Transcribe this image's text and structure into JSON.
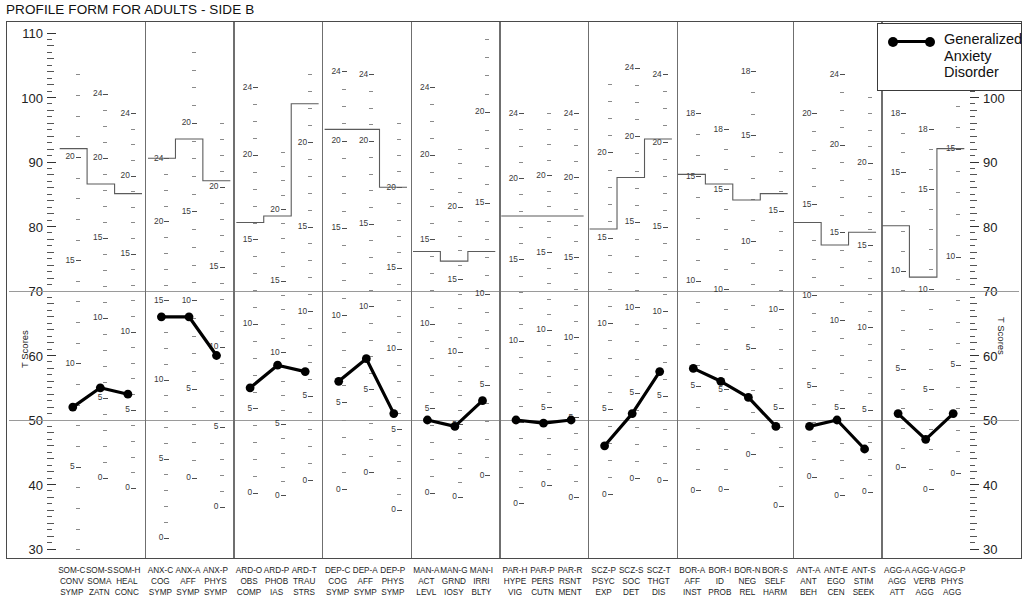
{
  "title": "PROFILE FORM FOR ADULTS - SIDE B",
  "axis": {
    "y_title": "T Scores",
    "y_ticks": [
      110,
      100,
      90,
      80,
      70,
      60,
      50,
      40,
      30
    ],
    "y_min": 30,
    "y_max": 110,
    "reference_lines": [
      70,
      50
    ]
  },
  "legend": {
    "position": "top-right",
    "entries": [
      {
        "label": "Generalized Anxiety Disorder",
        "marker": "line-with-dots",
        "color": "#000000"
      }
    ]
  },
  "chart_data": {
    "type": "line",
    "title": "PROFILE FORM FOR ADULTS - SIDE B",
    "xlabel": "",
    "ylabel": "T Scores",
    "ylim": [
      30,
      110
    ],
    "grid": false,
    "reference_lines": [
      70,
      50
    ],
    "legend": [
      "Generalized Anxiety Disorder"
    ],
    "categories": [
      "SOM-C",
      "SOM-S",
      "SOM-H",
      "ANX-C",
      "ANX-A",
      "ANX-P",
      "ARD-O",
      "ARD-P",
      "ARD-T",
      "DEP-C",
      "DEP-A",
      "DEP-P",
      "MAN-A",
      "MAN-G",
      "MAN-I",
      "PAR-H",
      "PAR-P",
      "PAR-R",
      "SCZ-P",
      "SCZ-S",
      "SCZ-T",
      "BOR-A",
      "BOR-I",
      "BOR-N",
      "BOR-S",
      "ANT-A",
      "ANT-E",
      "ANT-S",
      "AGG-A",
      "AGG-V",
      "AGG-P"
    ],
    "series": [
      {
        "name": "Generalized Anxiety Disorder",
        "values": [
          52,
          55,
          54,
          66,
          66,
          60,
          55,
          58.5,
          57.5,
          56,
          59.5,
          51,
          50,
          49,
          53,
          50,
          49.5,
          50,
          46,
          51,
          57.5,
          58,
          56,
          53.5,
          49,
          49,
          50,
          45.5,
          51,
          47,
          51
        ]
      }
    ]
  },
  "groups": [
    {
      "name": "SOM",
      "columns": [
        {
          "code": "SOM-C",
          "l1": "SOM-C",
          "l2": "CONV",
          "l3": "SYMP",
          "value": 52,
          "max_t": 92,
          "ladder": {
            "raw_top": 24,
            "t_top": 103.5,
            "t_per_raw": 3.2,
            "labels": [
              20,
              15,
              10,
              5,
              0
            ]
          }
        },
        {
          "code": "SOM-S",
          "l1": "SOM-S",
          "l2": "SOMA",
          "l3": "ZATN",
          "value": 55,
          "max_t": 86.5,
          "ladder": {
            "raw_top": 24,
            "t_top": 100.5,
            "t_per_raw": 2.48,
            "labels": [
              24,
              20,
              15,
              10,
              5,
              0
            ]
          }
        },
        {
          "code": "SOM-H",
          "l1": "SOM-H",
          "l2": "HEAL",
          "l3": "CONC",
          "value": 54,
          "max_t": 85,
          "ladder": {
            "raw_top": 24,
            "t_top": 97.5,
            "t_per_raw": 2.42,
            "labels": [
              24,
              20,
              15,
              10,
              5,
              0
            ]
          }
        }
      ]
    },
    {
      "name": "ANX",
      "columns": [
        {
          "code": "ANX-C",
          "l1": "ANX-C",
          "l2": "COG",
          "l3": "SYMP",
          "value": 66,
          "max_t": 90.5,
          "ladder": {
            "raw_top": 24,
            "t_top": 90.5,
            "t_per_raw": 2.45,
            "labels": [
              24,
              20,
              15,
              10,
              5,
              0
            ]
          }
        },
        {
          "code": "ANX-A",
          "l1": "ANX-A",
          "l2": "AFF",
          "l3": "SYMP",
          "value": 66,
          "max_t": 93.5,
          "ladder": {
            "raw_top": 24,
            "t_top": 107,
            "t_per_raw": 2.75,
            "labels": [
              20,
              15,
              10,
              5,
              0
            ]
          }
        },
        {
          "code": "ANX-P",
          "l1": "ANX-P",
          "l2": "PHYS",
          "l3": "SYMP",
          "value": 60,
          "max_t": 87,
          "ladder": {
            "raw_top": 24,
            "t_top": 96,
            "t_per_raw": 2.48,
            "labels": [
              20,
              15,
              10,
              5,
              0
            ]
          }
        }
      ]
    },
    {
      "name": "ARD",
      "columns": [
        {
          "code": "ARD-O",
          "l1": "ARD-O",
          "l2": "OBS",
          "l3": "COMP",
          "value": 55,
          "max_t": 80.5,
          "ladder": {
            "raw_top": 24,
            "t_top": 101.5,
            "t_per_raw": 2.62,
            "labels": [
              24,
              20,
              15,
              10,
              5,
              0
            ]
          }
        },
        {
          "code": "ARD-P",
          "l1": "ARD-P",
          "l2": "PHOB",
          "l3": "IAS",
          "value": 58.5,
          "max_t": 81.5,
          "ladder": {
            "raw_top": 24,
            "t_top": 91.5,
            "t_per_raw": 2.22,
            "labels": [
              20,
              15,
              10,
              5,
              0
            ]
          }
        },
        {
          "code": "ARD-T",
          "l1": "ARD-T",
          "l2": "TRAU",
          "l3": "STRS",
          "value": 57.5,
          "max_t": 99,
          "ladder": {
            "raw_top": 24,
            "t_top": 103.5,
            "t_per_raw": 2.62,
            "labels": [
              20,
              15,
              10,
              5,
              0
            ]
          }
        }
      ]
    },
    {
      "name": "DEP",
      "columns": [
        {
          "code": "DEP-C",
          "l1": "DEP-C",
          "l2": "COG",
          "l3": "SYMP",
          "value": 56,
          "max_t": 95,
          "ladder": {
            "raw_top": 24,
            "t_top": 104,
            "t_per_raw": 2.7,
            "labels": [
              24,
              20,
              15,
              10,
              5,
              0
            ]
          }
        },
        {
          "code": "DEP-A",
          "l1": "DEP-A",
          "l2": "AFF",
          "l3": "SYMP",
          "value": 59.5,
          "max_t": 95,
          "ladder": {
            "raw_top": 24,
            "t_top": 103.5,
            "t_per_raw": 2.57,
            "labels": [
              24,
              20,
              15,
              10,
              5,
              0
            ]
          }
        },
        {
          "code": "DEP-P",
          "l1": "DEP-P",
          "l2": "PHYS",
          "l3": "SYMP",
          "value": 51,
          "max_t": 86,
          "ladder": {
            "raw_top": 24,
            "t_top": 96,
            "t_per_raw": 2.5,
            "labels": [
              20,
              15,
              10,
              5,
              0
            ]
          }
        }
      ]
    },
    {
      "name": "MAN",
      "columns": [
        {
          "code": "MAN-A",
          "l1": "MAN-A",
          "l2": "ACT",
          "l3": "LEVL",
          "value": 50,
          "max_t": 76,
          "ladder": {
            "raw_top": 24,
            "t_top": 101.5,
            "t_per_raw": 2.62,
            "labels": [
              24,
              20,
              15,
              10,
              5,
              0
            ]
          }
        },
        {
          "code": "MAN-G",
          "l1": "MAN-G",
          "l2": "GRND",
          "l3": "IOSY",
          "value": 49,
          "max_t": 74.5,
          "ladder": {
            "raw_top": 24,
            "t_top": 92,
            "t_per_raw": 2.25,
            "labels": [
              20,
              15,
              10,
              5,
              0
            ]
          }
        },
        {
          "code": "MAN-I",
          "l1": "MAN-I",
          "l2": "IRRI",
          "l3": "BLTY",
          "value": 53,
          "max_t": 76,
          "ladder": {
            "raw_top": 24,
            "t_top": 109,
            "t_per_raw": 2.82,
            "labels": [
              20,
              15,
              10,
              5,
              0
            ]
          }
        }
      ]
    },
    {
      "name": "PAR",
      "columns": [
        {
          "code": "PAR-H",
          "l1": "PAR-H",
          "l2": "HYPE",
          "l3": "VIG",
          "value": 50,
          "max_t": 81.5,
          "ladder": {
            "raw_top": 24,
            "t_top": 97.5,
            "t_per_raw": 2.52,
            "labels": [
              24,
              20,
              15,
              10,
              5,
              0
            ]
          }
        },
        {
          "code": "PAR-P",
          "l1": "PAR-P",
          "l2": "PERS",
          "l3": "CUTN",
          "value": 49.5,
          "max_t": 81.5,
          "ladder": {
            "raw_top": 24,
            "t_top": 97.5,
            "t_per_raw": 2.4,
            "labels": [
              20,
              15,
              10,
              5,
              0
            ]
          }
        },
        {
          "code": "PAR-R",
          "l1": "PAR-R",
          "l2": "RSNT",
          "l3": "MENT",
          "value": 50,
          "max_t": 81.5,
          "ladder": {
            "raw_top": 24,
            "t_top": 97.5,
            "t_per_raw": 2.48,
            "labels": [
              24,
              20,
              15,
              10,
              5,
              0
            ]
          }
        }
      ]
    },
    {
      "name": "SCZ",
      "columns": [
        {
          "code": "SCZ-P",
          "l1": "SCZ-P",
          "l2": "PSYC",
          "l3": "EXP",
          "value": 46,
          "max_t": 79.5,
          "ladder": {
            "raw_top": 24,
            "t_top": 102,
            "t_per_raw": 2.65,
            "labels": [
              20,
              15,
              10,
              5,
              0
            ]
          }
        },
        {
          "code": "SCZ-S",
          "l1": "SCZ-S",
          "l2": "SOC",
          "l3": "DET",
          "value": 51,
          "max_t": 87.5,
          "ladder": {
            "raw_top": 24,
            "t_top": 104.5,
            "t_per_raw": 2.65,
            "labels": [
              24,
              20,
              15,
              10,
              5,
              0
            ]
          }
        },
        {
          "code": "SCZ-T",
          "l1": "SCZ-T",
          "l2": "THGT",
          "l3": "DIS",
          "value": 57.5,
          "max_t": 93.5,
          "ladder": {
            "raw_top": 24,
            "t_top": 103.5,
            "t_per_raw": 2.62,
            "labels": [
              24,
              20,
              15,
              10,
              5,
              0
            ]
          }
        }
      ]
    },
    {
      "name": "BOR",
      "columns": [
        {
          "code": "BOR-A",
          "l1": "BOR-A",
          "l2": "AFF",
          "l3": "INST",
          "value": 58,
          "max_t": 88,
          "ladder": {
            "raw_top": 18,
            "t_top": 97.5,
            "t_per_raw": 3.25,
            "labels": [
              18,
              15,
              10,
              5,
              0
            ]
          }
        },
        {
          "code": "BOR-I",
          "l1": "BOR-I",
          "l2": "ID",
          "l3": "PROB",
          "value": 56,
          "max_t": 86.5,
          "ladder": {
            "raw_top": 18,
            "t_top": 95,
            "t_per_raw": 3.1,
            "labels": [
              18,
              15,
              10,
              5,
              0
            ]
          }
        },
        {
          "code": "BOR-N",
          "l1": "BOR-N",
          "l2": "NEG",
          "l3": "REL",
          "value": 53.5,
          "max_t": 84,
          "ladder": {
            "raw_top": 18,
            "t_top": 104,
            "t_per_raw": 3.3,
            "labels": [
              18,
              15,
              10,
              5,
              0
            ]
          }
        },
        {
          "code": "BOR-S",
          "l1": "BOR-S",
          "l2": "SELF",
          "l3": "HARM",
          "value": 49,
          "max_t": 85,
          "ladder": {
            "raw_top": 18,
            "t_top": 91.5,
            "t_per_raw": 3.05,
            "labels": [
              15,
              10,
              5,
              0
            ]
          }
        }
      ]
    },
    {
      "name": "ANT",
      "columns": [
        {
          "code": "ANT-A",
          "l1": "ANT-A",
          "l2": "ANT",
          "l3": "BEH",
          "value": 49,
          "max_t": 80.5,
          "ladder": {
            "raw_top": 20,
            "t_top": 97.5,
            "t_per_raw": 2.82,
            "labels": [
              20,
              15,
              10,
              5,
              0
            ]
          }
        },
        {
          "code": "ANT-E",
          "l1": "ANT-E",
          "l2": "EGO",
          "l3": "CEN",
          "value": 50,
          "max_t": 77,
          "ladder": {
            "raw_top": 24,
            "t_top": 103.5,
            "t_per_raw": 2.72,
            "labels": [
              24,
              20,
              15,
              10,
              5,
              0
            ]
          }
        },
        {
          "code": "ANT-S",
          "l1": "ANT-S",
          "l2": "STIM",
          "l3": "SEEK",
          "value": 45.5,
          "max_t": 79,
          "ladder": {
            "raw_top": 24,
            "t_top": 100,
            "t_per_raw": 2.55,
            "labels": [
              20,
              15,
              10,
              5,
              0
            ]
          }
        }
      ]
    },
    {
      "name": "AGG",
      "columns": [
        {
          "code": "AGG-A",
          "l1": "AGG-A",
          "l2": "AGG",
          "l3": "ATT",
          "value": 51,
          "max_t": 80,
          "ladder": {
            "raw_top": 18,
            "t_top": 97.5,
            "t_per_raw": 3.05,
            "labels": [
              18,
              15,
              10,
              5,
              0
            ]
          }
        },
        {
          "code": "AGG-V",
          "l1": "AGG-V",
          "l2": "VERB",
          "l3": "AGG",
          "value": 47,
          "max_t": 72,
          "ladder": {
            "raw_top": 18,
            "t_top": 95,
            "t_per_raw": 3.1,
            "labels": [
              18,
              15,
              10,
              5,
              0
            ]
          }
        },
        {
          "code": "AGG-P",
          "l1": "AGG-P",
          "l2": "PHYS",
          "l3": "AGG",
          "value": 51,
          "max_t": 92,
          "ladder": {
            "raw_top": 18,
            "t_top": 102,
            "t_per_raw": 3.35,
            "labels": [
              15,
              10,
              5,
              0
            ]
          }
        }
      ]
    }
  ]
}
